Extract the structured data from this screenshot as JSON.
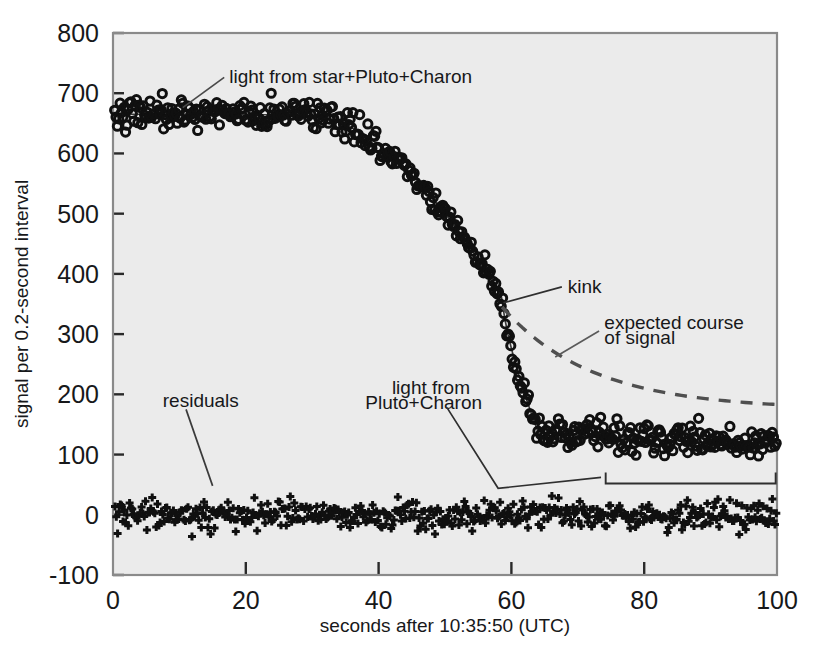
{
  "chart_data": {
    "type": "scatter",
    "title": "",
    "xlabel": "seconds after 10:35:50 (UTC)",
    "ylabel": "signal per 0.2-second interval",
    "xlim": [
      0,
      100
    ],
    "ylim": [
      -100,
      800
    ],
    "xticks": [
      "0",
      "20",
      "40",
      "60",
      "80",
      "100"
    ],
    "xtick_values": [
      0,
      20,
      40,
      60,
      80,
      100
    ],
    "yticks": [
      "800",
      "700",
      "600",
      "500",
      "400",
      "300",
      "200",
      "100",
      "0",
      "-100"
    ],
    "ytick_values": [
      800,
      700,
      600,
      500,
      400,
      300,
      200,
      100,
      0,
      -100
    ],
    "grid": false,
    "legend": "none",
    "plot_background": "#ebebeb",
    "marker_color": "#101010",
    "dashed_curve_color": "#4f4f4f",
    "series": [
      {
        "name": "light curve (occultation signal)",
        "marker": "open-circle",
        "sample_interval_seconds": 0.2,
        "description": "signal drops from ~665 counts (star+Pluto+Charon) to ~120 counts (Pluto+Charon only) during immersion",
        "baseline_before": 665,
        "baseline_after": 120,
        "ingress_start_s": 37,
        "ingress_end_s": 64,
        "kink_s": 58.6,
        "kink_value": 355,
        "noise_sigma": 22
      },
      {
        "name": "model fit",
        "marker": "solid-line",
        "description": "solid curve drawn through observed light curve"
      },
      {
        "name": "expected course of signal",
        "marker": "dashed-line",
        "description": "extrapolated smooth decay had no kink occurred",
        "start_s": 58.6,
        "start_value": 345,
        "end_s": 100,
        "end_value": 175
      },
      {
        "name": "residuals",
        "marker": "plus",
        "description": "data minus model, scattered about zero",
        "mean": 0,
        "noise_sigma": 20
      }
    ],
    "annotations": [
      {
        "id": "star-pluto-charon",
        "text": "light from star+Pluto+Charon",
        "text_x_s": 17.5,
        "text_y": 728,
        "point_x_s": 10.5,
        "point_y": 676
      },
      {
        "id": "kink",
        "text": "kink",
        "text_x_s": 68.5,
        "text_y": 380,
        "point_x_s": 58.8,
        "point_y": 352
      },
      {
        "id": "expected-course-1",
        "text": "expected course",
        "text_x_s": 74,
        "text_y": 320
      },
      {
        "id": "expected-course-2",
        "text": "of signal",
        "text_x_s": 74,
        "text_y": 295
      },
      {
        "id": "pluto-charon",
        "text": "light from",
        "text_x_s": 42,
        "text_y": 212
      },
      {
        "id": "pluto-charon-2",
        "text": "Pluto+Charon",
        "text_x_s": 38,
        "text_y": 187
      },
      {
        "id": "residuals",
        "text": "residuals",
        "text_x_s": 7.5,
        "text_y": 190,
        "point_x_s": 15,
        "point_y": 48
      },
      {
        "id": "bracket",
        "text": "",
        "from_x_s": 74.2,
        "to_x_s": 99.8,
        "y": 52
      }
    ]
  },
  "figure": {
    "caption": ""
  }
}
